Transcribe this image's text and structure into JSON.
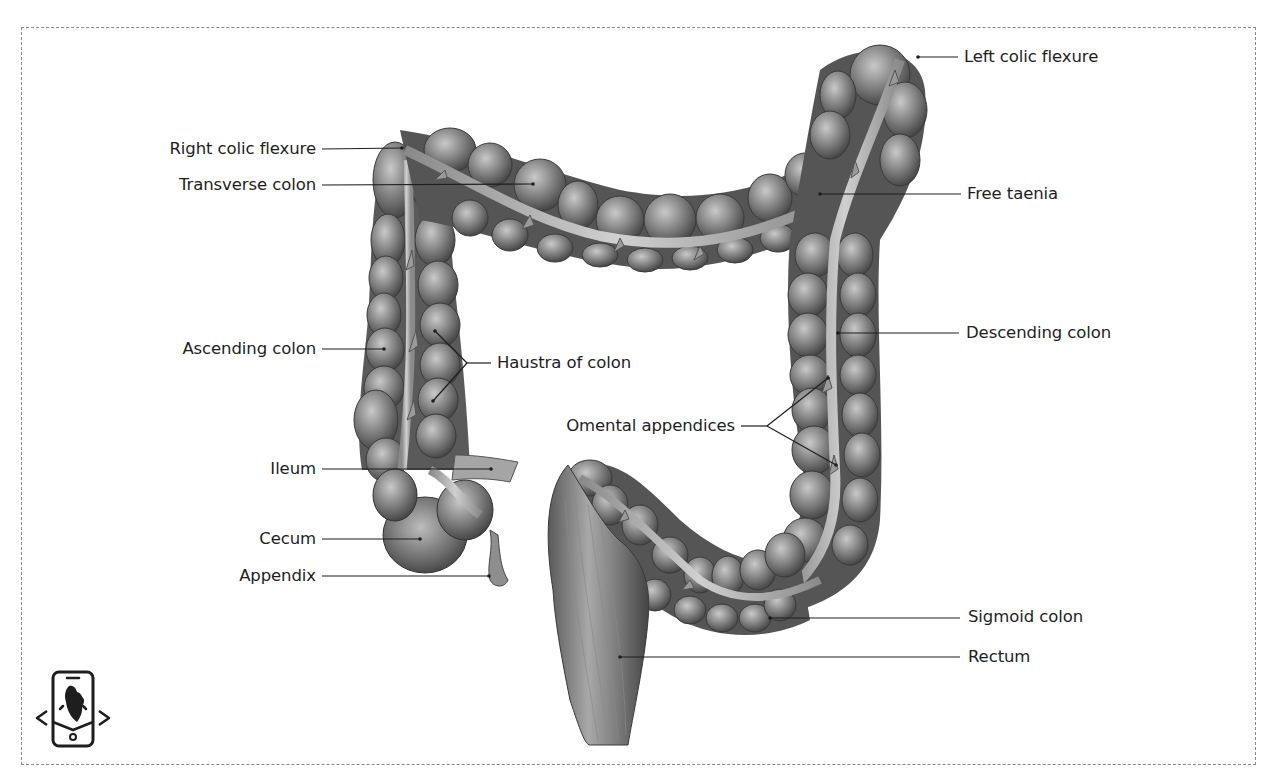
{
  "diagram": {
    "labels_left": [
      {
        "id": "right_colic_flexure",
        "text": "Right colic flexure"
      },
      {
        "id": "transverse_colon",
        "text": "Transverse colon"
      },
      {
        "id": "ascending_colon",
        "text": "Ascending colon"
      },
      {
        "id": "ileum",
        "text": "Ileum"
      },
      {
        "id": "cecum",
        "text": "Cecum"
      },
      {
        "id": "appendix",
        "text": "Appendix"
      }
    ],
    "labels_center": [
      {
        "id": "haustra_of_colon",
        "text": "Haustra of colon"
      },
      {
        "id": "omental_appendices",
        "text": "Omental appendices"
      }
    ],
    "labels_right": [
      {
        "id": "left_colic_flexure",
        "text": "Left colic flexure"
      },
      {
        "id": "free_taenia",
        "text": "Free taenia"
      },
      {
        "id": "descending_colon",
        "text": "Descending colon"
      },
      {
        "id": "sigmoid_colon",
        "text": "Sigmoid colon"
      },
      {
        "id": "rectum",
        "text": "Rectum"
      }
    ]
  },
  "logo": {
    "icon": "mobile-anatomy-heart-icon"
  },
  "colors": {
    "leader_line": "#1e1e1e",
    "frame": "#8a8a8a",
    "tissue_dark": "#4a4a4a",
    "tissue_mid": "#7a7a7a",
    "tissue_light": "#b5b5b5"
  }
}
